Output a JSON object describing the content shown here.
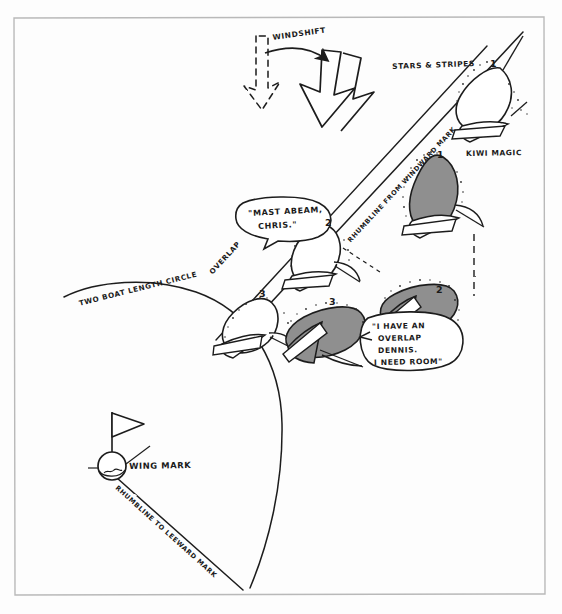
{
  "figure": {
    "kind": "hand-drawn sailing tactics diagram",
    "background_color": "#fdfdfd",
    "ink_color": "#1d1d1d",
    "hull_fill_gray": "#8f8f8f",
    "hull_fill_white": "#ffffff",
    "frame": {
      "x": 14,
      "y": 17,
      "width": 531,
      "height": 578
    }
  },
  "annotations": {
    "windshift": "WINDSHIFT",
    "stars_and_stripes": "STARS & STRIPES",
    "kiwi_magic": "KIWI MAGIC",
    "rhumbline_from_windward": "RHUMBLINE FROM WINDWARD MARK",
    "overlap": "OVERLAP",
    "two_boat_length_circle": "TWO BOAT LENGTH CIRCLE",
    "wing_mark": "WING MARK",
    "rhumbline_to_leeward": "RHUMBLINE TO LEEWARD MARK"
  },
  "speech_bubbles": [
    {
      "id": "mast-abeam",
      "lines": [
        "\"MAST ABEAM,",
        "CHRIS.\""
      ]
    },
    {
      "id": "overlap-room",
      "lines": [
        "\"I HAVE AN",
        "OVERLAP",
        "DENNIS.",
        "I NEED ROOM\""
      ]
    }
  ],
  "boat_positions": [
    {
      "label": "1",
      "hull": "white",
      "boat": "STARS & STRIPES"
    },
    {
      "label": "1",
      "hull": "gray",
      "boat": "KIWI MAGIC"
    },
    {
      "label": "2",
      "hull": "white",
      "boat": "STARS & STRIPES"
    },
    {
      "label": "2",
      "hull": "gray",
      "boat": "KIWI MAGIC"
    },
    {
      "label": "3",
      "hull": "white",
      "boat": "STARS & STRIPES"
    },
    {
      "label": "3",
      "hull": "gray",
      "boat": "KIWI MAGIC"
    }
  ],
  "marks": [
    {
      "name": "wing-mark",
      "type": "buoy-with-flag"
    }
  ]
}
